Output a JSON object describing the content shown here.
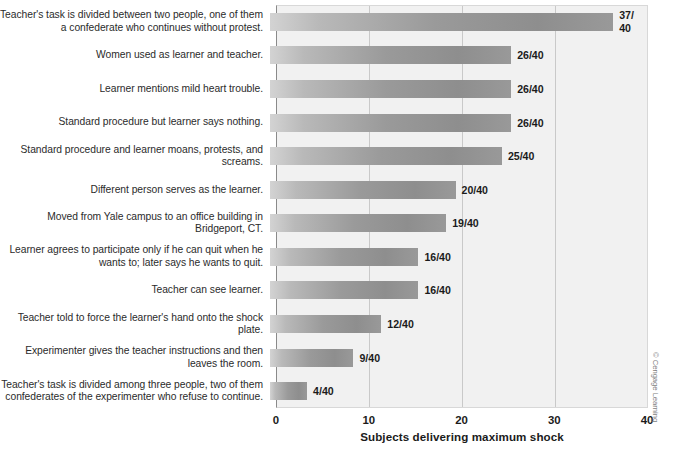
{
  "chart_data": {
    "type": "bar",
    "orientation": "horizontal",
    "title": "",
    "xlabel": "Subjects delivering maximum shock",
    "ylabel": "",
    "xlim": [
      0,
      40
    ],
    "xticks": [
      "0",
      "10",
      "20",
      "30",
      "40"
    ],
    "grid": true,
    "legend": null,
    "categories": [
      "Teacher's task is divided between two people, one of them a confederate who continues without protest.",
      "Women used as learner and teacher.",
      "Learner mentions mild heart trouble.",
      "Standard procedure but learner says nothing.",
      "Standard procedure and learner moans, protests, and screams.",
      "Different person serves as the learner.",
      "Moved from Yale campus to an office building in Bridgeport, CT.",
      "Learner agrees to participate only if he can quit when he wants to; later says he wants to quit.",
      "Teacher can see learner.",
      "Teacher told to force the learner's hand onto the shock plate.",
      "Experimenter gives the teacher instructions and then leaves the room.",
      "Teacher's task is divided among three people, two of them confederates of the experimenter who refuse to continue."
    ],
    "values": [
      37,
      26,
      26,
      26,
      25,
      20,
      19,
      16,
      16,
      12,
      9,
      4
    ],
    "value_labels": [
      "37/\n40",
      "26/40",
      "26/40",
      "26/40",
      "25/40",
      "20/40",
      "19/40",
      "16/40",
      "16/40",
      "12/40",
      "9/40",
      "4/40"
    ]
  },
  "credit": "© Cengage Learning",
  "colors": {
    "bar_light": "#d3d3d3",
    "bar_dark": "#8e8e8e",
    "plot_background": "#f1f1f1",
    "gridline": "#c9c9c9",
    "axis": "#8a8a8a",
    "text": "#1b1b1b"
  }
}
